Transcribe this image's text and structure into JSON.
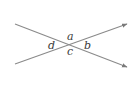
{
  "diagram": {
    "colors": {
      "line": "#8a8a8a",
      "label": "#3a3a3a"
    },
    "labels": {
      "top": "a",
      "right": "b",
      "bottom": "c",
      "left": "d"
    },
    "lines": [
      {
        "name": "line-1",
        "arrow": "end"
      },
      {
        "name": "line-2",
        "arrow": "end"
      }
    ]
  }
}
